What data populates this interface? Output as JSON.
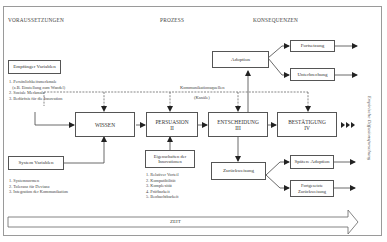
{
  "headers": {
    "left": "VORAUSSETZUNGEN",
    "middle": "PROZESS",
    "right": "KONSEQUENZEN"
  },
  "receiver": {
    "title": "Empfänger Variablen",
    "items": [
      "1. Persönlichkeitsmerkmale",
      "   (z.B. Einstellung zum Wandel)",
      "2. Soziale Merkmale",
      "3. Bedürfnis für die Innovation"
    ]
  },
  "system": {
    "title": "System Variablen",
    "items": [
      "1. Systemnormen",
      "2. Toleranz für Devianz",
      "3. Integration der Kommunikation"
    ]
  },
  "channels": {
    "line1": "Kommunikationsquellen",
    "line2": "(Kanäle)"
  },
  "stages": [
    {
      "name": "WISSEN",
      "num": "I"
    },
    {
      "name": "PERSUASION",
      "num": "II"
    },
    {
      "name": "ENTSCHEIDUNG",
      "num": "III"
    },
    {
      "name": "BESTÄTIGUNG",
      "num": "IV"
    }
  ],
  "innovation": {
    "title": "Eigenschaften der Innovationen",
    "items": [
      "1. Relativer Vorteil",
      "2. Kompatibilität",
      "3. Komplexität",
      "4. Prüfbarkeit",
      "5. Beobachtbarkeit"
    ]
  },
  "outcomes": {
    "adoption": "Adoption",
    "continuation": "Fortsetzung",
    "discontinuance": "Unterbrechung",
    "rejection": "Zurückweisung",
    "later_adoption": "Spätere Adoption",
    "continued_rejection": "Fortgesetzte Zurückweisung"
  },
  "side_label": "Empirische Diffusionsforschung",
  "time_label": "ZEIT"
}
